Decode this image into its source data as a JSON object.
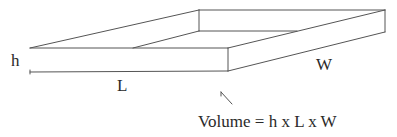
{
  "diagram": {
    "labels": {
      "height": "h",
      "length": "L",
      "width": "W",
      "formula": "Volume = h x L x W"
    },
    "colors": {
      "stroke": "#555555",
      "text": "#2a2a2a",
      "background": "#ffffff"
    }
  }
}
